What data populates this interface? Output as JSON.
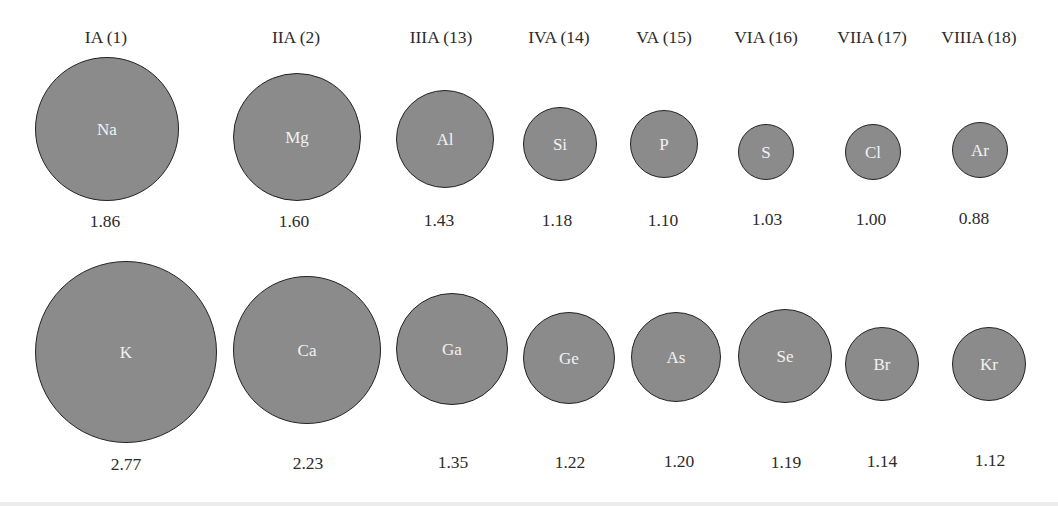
{
  "diagram": {
    "colors": {
      "atom_fill": "#8b8b8b",
      "atom_border": "#232323",
      "symbol_text": "#f2f2f2",
      "label_text": "#2b2b2b"
    },
    "group_headers": [
      {
        "label": "IA (1)",
        "x": 106
      },
      {
        "label": "IIA (2)",
        "x": 296
      },
      {
        "label": "IIIA (13)",
        "x": 441
      },
      {
        "label": "IVA (14)",
        "x": 559
      },
      {
        "label": "VA (15)",
        "x": 664
      },
      {
        "label": "VIA (16)",
        "x": 766
      },
      {
        "label": "VIIA (17)",
        "x": 872
      },
      {
        "label": "VIIIA (18)",
        "x": 979
      }
    ],
    "rows": [
      {
        "period": 3,
        "atoms": [
          {
            "symbol": "Na",
            "radius_value": "1.86",
            "cx": 107,
            "cy": 129,
            "r": 72,
            "label_x": 105,
            "label_y": 221
          },
          {
            "symbol": "Mg",
            "radius_value": "1.60",
            "cx": 297,
            "cy": 137,
            "r": 64,
            "label_x": 294,
            "label_y": 221
          },
          {
            "symbol": "Al",
            "radius_value": "1.43",
            "cx": 445,
            "cy": 139,
            "r": 49,
            "label_x": 439,
            "label_y": 220
          },
          {
            "symbol": "Si",
            "radius_value": "1.18",
            "cx": 560,
            "cy": 144,
            "r": 37,
            "label_x": 557,
            "label_y": 220
          },
          {
            "symbol": "P",
            "radius_value": "1.10",
            "cx": 664,
            "cy": 144,
            "r": 34,
            "label_x": 663,
            "label_y": 220
          },
          {
            "symbol": "S",
            "radius_value": "1.03",
            "cx": 766,
            "cy": 152,
            "r": 28,
            "label_x": 767,
            "label_y": 219
          },
          {
            "symbol": "Cl",
            "radius_value": "1.00",
            "cx": 873,
            "cy": 152,
            "r": 28,
            "label_x": 871,
            "label_y": 219
          },
          {
            "symbol": "Ar",
            "radius_value": "0.88",
            "cx": 980,
            "cy": 150,
            "r": 28,
            "label_x": 974,
            "label_y": 218
          }
        ]
      },
      {
        "period": 4,
        "atoms": [
          {
            "symbol": "K",
            "radius_value": "2.77",
            "cx": 126,
            "cy": 352,
            "r": 91,
            "label_x": 126,
            "label_y": 464
          },
          {
            "symbol": "Ca",
            "radius_value": "2.23",
            "cx": 307,
            "cy": 350,
            "r": 74,
            "label_x": 308,
            "label_y": 463
          },
          {
            "symbol": "Ga",
            "radius_value": "1.35",
            "cx": 452,
            "cy": 349,
            "r": 56,
            "label_x": 453,
            "label_y": 462
          },
          {
            "symbol": "Ge",
            "radius_value": "1.22",
            "cx": 569,
            "cy": 358,
            "r": 46,
            "label_x": 570,
            "label_y": 462
          },
          {
            "symbol": "As",
            "radius_value": "1.20",
            "cx": 676,
            "cy": 357,
            "r": 45,
            "label_x": 679,
            "label_y": 461
          },
          {
            "symbol": "Se",
            "radius_value": "1.19",
            "cx": 785,
            "cy": 356,
            "r": 47,
            "label_x": 786,
            "label_y": 462
          },
          {
            "symbol": "Br",
            "radius_value": "1.14",
            "cx": 882,
            "cy": 364,
            "r": 37,
            "label_x": 882,
            "label_y": 461
          },
          {
            "symbol": "Kr",
            "radius_value": "1.12",
            "cx": 989,
            "cy": 364,
            "r": 37,
            "label_x": 990,
            "label_y": 460
          }
        ]
      }
    ]
  }
}
